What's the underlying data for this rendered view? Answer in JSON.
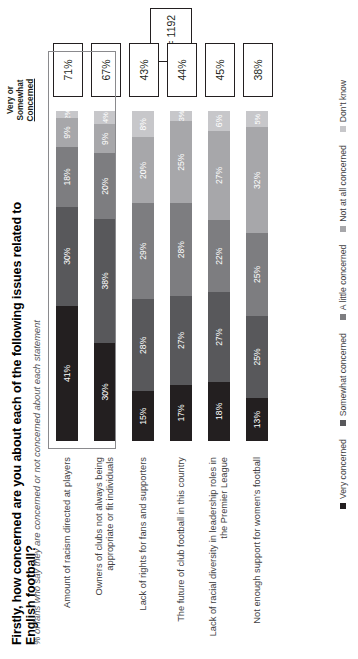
{
  "header": {
    "title": "Firstly, how concerned are you about each of the following issues related to English football?",
    "subtitle": "% of fans who say they are concerned or not concerned about each statement",
    "summary_column_header_line1": "Very or",
    "summary_column_header_line2": "Somewhat",
    "summary_column_header_line3": "Concerned",
    "sample_size": "n = 1192"
  },
  "colors": {
    "very_concerned": "#231f20",
    "somewhat_concerned": "#58585b",
    "a_little_concerned": "#7d7d80",
    "not_at_all_concerned": "#a7a7aa",
    "dont_know": "#c7c7ca",
    "highlight_border": "#8a8a8d",
    "box_border": "#231f20"
  },
  "chart_data": {
    "type": "bar",
    "title": "Firstly, how concerned are you about each of the following issues related to English football?",
    "subtitle": "% of fans who say they are concerned or not concerned about each statement",
    "xlabel": "",
    "ylabel": "",
    "xlim": [
      0,
      100
    ],
    "grid": false,
    "stacked": true,
    "orientation": "horizontal",
    "legend_position": "bottom",
    "categories": [
      "Amount of racism directed at players",
      "Owners of clubs not always being appropriate or fit individuals",
      "Lack of rights for fans and supporters",
      "The future of club football in this country",
      "Lack of racial diversity in leadership roles in the Premier League",
      "Not enough support for women's football"
    ],
    "series": [
      {
        "name": "Very concerned",
        "values": [
          41,
          30,
          15,
          17,
          18,
          13
        ]
      },
      {
        "name": "Somewhat concerned",
        "values": [
          30,
          38,
          28,
          27,
          27,
          25
        ]
      },
      {
        "name": "A little concerned",
        "values": [
          18,
          20,
          29,
          28,
          22,
          25
        ]
      },
      {
        "name": "Not at all concerned",
        "values": [
          9,
          9,
          20,
          25,
          27,
          32
        ]
      },
      {
        "name": "Don't know",
        "values": [
          2,
          4,
          8,
          3,
          6,
          5
        ]
      }
    ],
    "summary_column_label": "Very or Somewhat Concerned",
    "summary_values": [
      "71%",
      "67%",
      "43%",
      "44%",
      "45%",
      "38%"
    ],
    "highlighted_categories": [
      0,
      1
    ],
    "annotations": [
      "n = 1192"
    ]
  },
  "rows": [
    {
      "label": "Amount of racism directed at players",
      "total": "71%",
      "segments": [
        {
          "label": "41%",
          "value": 41
        },
        {
          "label": "30%",
          "value": 30
        },
        {
          "label": "18%",
          "value": 18
        },
        {
          "label": "9%",
          "value": 9
        },
        {
          "label": "2%",
          "value": 2
        }
      ]
    },
    {
      "label": "Owners of clubs not always being appropriate or fit individuals",
      "total": "67%",
      "segments": [
        {
          "label": "30%",
          "value": 30
        },
        {
          "label": "38%",
          "value": 38
        },
        {
          "label": "20%",
          "value": 20
        },
        {
          "label": "9%",
          "value": 9
        },
        {
          "label": "4%",
          "value": 4
        }
      ]
    },
    {
      "label": "Lack of rights for fans and supporters",
      "total": "43%",
      "segments": [
        {
          "label": "15%",
          "value": 15
        },
        {
          "label": "28%",
          "value": 28
        },
        {
          "label": "29%",
          "value": 29
        },
        {
          "label": "20%",
          "value": 20
        },
        {
          "label": "8%",
          "value": 8
        }
      ]
    },
    {
      "label": "The future of club football in this country",
      "total": "44%",
      "segments": [
        {
          "label": "17%",
          "value": 17
        },
        {
          "label": "27%",
          "value": 27
        },
        {
          "label": "28%",
          "value": 28
        },
        {
          "label": "25%",
          "value": 25
        },
        {
          "label": "3%",
          "value": 3
        }
      ]
    },
    {
      "label": "Lack of racial diversity in leadership roles in the Premier League",
      "total": "45%",
      "segments": [
        {
          "label": "18%",
          "value": 18
        },
        {
          "label": "27%",
          "value": 27
        },
        {
          "label": "22%",
          "value": 22
        },
        {
          "label": "27%",
          "value": 27
        },
        {
          "label": "6%",
          "value": 6
        }
      ]
    },
    {
      "label": "Not enough support for women's football",
      "total": "38%",
      "segments": [
        {
          "label": "13%",
          "value": 13
        },
        {
          "label": "25%",
          "value": 25
        },
        {
          "label": "25%",
          "value": 25
        },
        {
          "label": "32%",
          "value": 32
        },
        {
          "label": "5%",
          "value": 5
        }
      ]
    }
  ],
  "legend": [
    {
      "label": "Very concerned"
    },
    {
      "label": "Somewhat concerned"
    },
    {
      "label": "A little concerned"
    },
    {
      "label": "Not at all concerned"
    },
    {
      "label": "Don't know"
    }
  ]
}
